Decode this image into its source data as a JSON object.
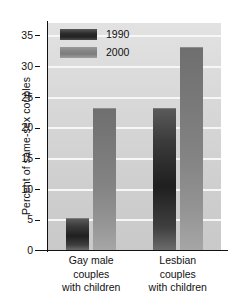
{
  "chart_data": {
    "type": "bar",
    "title": "",
    "xlabel": "",
    "ylabel": "Percent of same-sex couples",
    "categories": [
      "Gay male couples with children",
      "Lesbian couples with children"
    ],
    "category_lines": [
      [
        "Gay male",
        "couples",
        "with children"
      ],
      [
        "Lesbian",
        "couples",
        "with children"
      ]
    ],
    "series": [
      {
        "name": "1990",
        "values": [
          5,
          23
        ],
        "color": "#2c2c2c"
      },
      {
        "name": "2000",
        "values": [
          23,
          33
        ],
        "color": "#858585"
      }
    ],
    "ylim": [
      0,
      37
    ],
    "yticks": [
      0,
      5,
      10,
      15,
      20,
      25,
      30,
      35
    ],
    "ytick_labels": [
      "0",
      "5",
      "10",
      "15",
      "20",
      "25",
      "30",
      "35"
    ],
    "grid": true,
    "grid_axis": "y",
    "legend_position": "upper left",
    "legend_entries": [
      "1990",
      "2000"
    ],
    "plot_background": "#d6d6d6",
    "gridline_color": "#f7f7f7",
    "figure_background": "#ffffff"
  }
}
